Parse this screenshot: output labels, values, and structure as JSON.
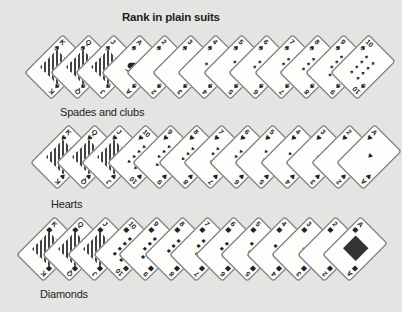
{
  "title": "Rank in plain suits",
  "rows": [
    {
      "caption": "Spades and clubs",
      "suit_icon": "spade",
      "glyph": "♠",
      "cards": [
        "K",
        "Q",
        "J",
        "A",
        "2",
        "3",
        "4",
        "5",
        "6",
        "7",
        "8",
        "9",
        "10"
      ]
    },
    {
      "caption": "Hearts",
      "suit_icon": "heart",
      "glyph": "♥",
      "cards": [
        "K",
        "Q",
        "J",
        "10",
        "9",
        "8",
        "7",
        "6",
        "5",
        "4",
        "3",
        "2",
        "A"
      ]
    },
    {
      "caption": "Diamonds",
      "suit_icon": "diamond",
      "glyph": "■",
      "cards": [
        "K",
        "Q",
        "J",
        "10",
        "9",
        "8",
        "7",
        "6",
        "5",
        "4",
        "3",
        "2",
        "A"
      ]
    }
  ],
  "colors": {
    "background": "#e4e4e2",
    "card": "#fdfdfb",
    "ink": "#222222"
  }
}
